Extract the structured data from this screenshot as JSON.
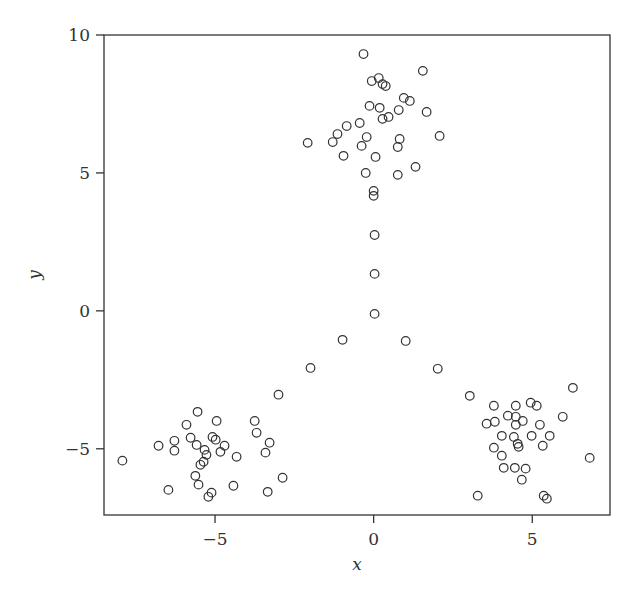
{
  "chart_data": {
    "type": "scatter",
    "title": "",
    "xlabel": "x",
    "ylabel": "y",
    "xlim": [
      -8.5,
      7.45
    ],
    "ylim": [
      -7.4,
      10.0
    ],
    "xticks": [
      -5,
      0,
      5
    ],
    "xtick_labels": [
      "−5",
      "0",
      "5"
    ],
    "yticks": [
      -5,
      0,
      5,
      10
    ],
    "ytick_labels": [
      "−5",
      "0",
      "5",
      "10"
    ],
    "grid": false,
    "legend": null,
    "marker": "open-circle",
    "marker_color": "#333333",
    "series": [
      {
        "name": "points",
        "x": [
          -0.32,
          1.55,
          -0.06,
          0.16,
          0.28,
          0.38,
          0.95,
          1.14,
          -0.13,
          0.19,
          0.79,
          1.67,
          0.47,
          0.28,
          -0.44,
          -0.85,
          -1.14,
          -1.29,
          -2.08,
          -0.22,
          -0.38,
          0.82,
          0.76,
          2.08,
          -0.95,
          0.06,
          -0.25,
          0.76,
          1.32,
          0.0,
          0.0,
          0.03,
          0.03,
          0.03,
          -0.98,
          1.01,
          -1.99,
          2.02,
          -3.0,
          3.03,
          -7.92,
          -6.78,
          -6.28,
          -6.28,
          -5.9,
          -5.55,
          -5.77,
          -5.58,
          -4.95,
          -5.08,
          -4.98,
          -4.7,
          -4.83,
          -5.33,
          -5.27,
          -5.36,
          -5.46,
          -4.32,
          -3.75,
          -3.69,
          -3.28,
          -3.41,
          -5.62,
          -5.52,
          -6.47,
          -5.11,
          -5.21,
          -4.42,
          -3.34,
          -2.87,
          6.28,
          3.79,
          4.48,
          4.95,
          5.14,
          4.23,
          4.48,
          4.7,
          3.82,
          3.56,
          4.48,
          5.96,
          5.24,
          4.04,
          4.42,
          4.98,
          5.55,
          4.54,
          4.57,
          5.33,
          3.79,
          4.04,
          6.81,
          4.1,
          4.45,
          4.79,
          4.67,
          3.28,
          5.36,
          5.46
        ],
        "y": [
          9.31,
          8.7,
          8.33,
          8.44,
          8.22,
          8.15,
          7.72,
          7.61,
          7.43,
          7.36,
          7.28,
          7.21,
          7.03,
          6.96,
          6.81,
          6.7,
          6.41,
          6.12,
          6.09,
          6.3,
          5.98,
          6.23,
          5.94,
          6.34,
          5.62,
          5.58,
          5.0,
          4.93,
          5.22,
          4.35,
          4.17,
          2.75,
          1.34,
          -0.11,
          -1.05,
          -1.09,
          -2.07,
          -2.1,
          -3.04,
          -3.08,
          -5.43,
          -4.89,
          -4.71,
          -5.07,
          -4.13,
          -3.66,
          -4.6,
          -4.86,
          -3.99,
          -4.57,
          -4.67,
          -4.89,
          -5.11,
          -5.04,
          -5.22,
          -5.47,
          -5.58,
          -5.29,
          -3.99,
          -4.42,
          -4.78,
          -5.14,
          -5.98,
          -6.3,
          -6.49,
          -6.59,
          -6.74,
          -6.34,
          -6.56,
          -6.05,
          -2.79,
          -3.44,
          -3.44,
          -3.33,
          -3.44,
          -3.8,
          -3.84,
          -3.99,
          -4.02,
          -4.09,
          -4.13,
          -3.84,
          -4.13,
          -4.53,
          -4.57,
          -4.53,
          -4.53,
          -4.82,
          -4.93,
          -4.89,
          -4.96,
          -5.25,
          -5.33,
          -5.69,
          -5.69,
          -5.72,
          -6.12,
          -6.7,
          -6.7,
          -6.81
        ]
      }
    ]
  },
  "layout": {
    "plot_left_px": 104,
    "plot_top_px": 35,
    "plot_right_px": 610,
    "plot_bottom_px": 515
  }
}
